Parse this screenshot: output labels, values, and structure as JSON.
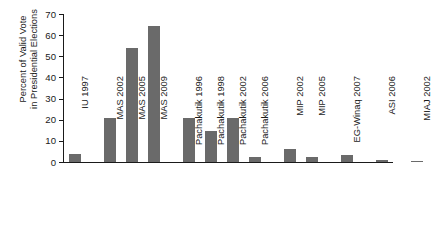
{
  "chart_data": {
    "type": "bar",
    "title": "",
    "subtitle": "",
    "xlabel": "",
    "ylabel": "Percent of Valid Vote in Presidential Elections",
    "ylabel_lines": [
      "Percent of Valid Vote",
      "in Presidential Elections"
    ],
    "ylim": [
      0,
      70
    ],
    "yticks": [
      0,
      10,
      20,
      30,
      40,
      50,
      60,
      70
    ],
    "ytick_labels": [
      "0",
      "10",
      "20",
      "30",
      "40",
      "50",
      "60",
      "70"
    ],
    "grid": false,
    "legend": false,
    "legend_position": "none",
    "bar_color": "#6a6a6a",
    "axis_color": "#1a1a1a",
    "categories": [
      "IU 1997",
      "MAS 2002",
      "MAS 2005",
      "MAS 2009",
      "Pachakutik 1996",
      "Pachakutik 1998",
      "Pachakutik 2002",
      "Pachakutik 2006",
      "MIP 2002",
      "MIP 2005",
      "EG-Winaq 2007",
      "ASI 2006",
      "MIAJ 2002"
    ],
    "values": [
      3.8,
      20.9,
      53.7,
      64.2,
      20.6,
      14.8,
      20.9,
      2.2,
      6.1,
      2.2,
      3.1,
      1.0,
      0.6
    ],
    "groups": [
      {
        "name": "IU",
        "categories": [
          "IU 1997"
        ]
      },
      {
        "name": "MAS",
        "categories": [
          "MAS 2002",
          "MAS 2005",
          "MAS 2009"
        ]
      },
      {
        "name": "Pachakutik",
        "categories": [
          "Pachakutik 1996",
          "Pachakutik 1998",
          "Pachakutik 2002",
          "Pachakutik 2006"
        ]
      },
      {
        "name": "MIP",
        "categories": [
          "MIP 2002",
          "MIP 2005"
        ]
      },
      {
        "name": "EG-Winaq",
        "categories": [
          "EG-Winaq 2007"
        ]
      },
      {
        "name": "ASI",
        "categories": [
          "ASI 2006"
        ]
      },
      {
        "name": "MIAJ",
        "categories": [
          "MIAJ 2002"
        ]
      }
    ]
  }
}
